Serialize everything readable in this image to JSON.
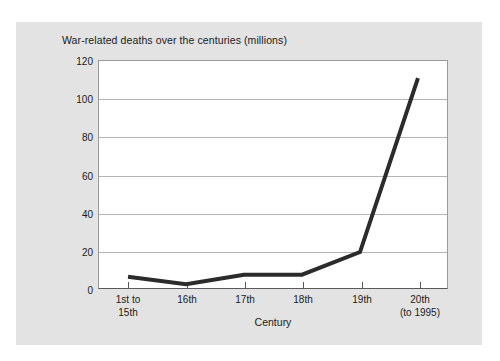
{
  "chart_data": {
    "type": "line",
    "title": "War-related deaths over the centuries (millions)",
    "xlabel": "Century",
    "ylabel": "",
    "categories": [
      "1st to\n15th",
      "16th",
      "17th",
      "18th",
      "19th",
      "20th\n(to 1995)"
    ],
    "category_labels": [
      [
        "1st to",
        "15th"
      ],
      [
        "16th"
      ],
      [
        "17th"
      ],
      [
        "18th"
      ],
      [
        "19th"
      ],
      [
        "20th",
        "(to 1995)"
      ]
    ],
    "values": [
      6,
      2,
      7,
      7,
      19,
      111
    ],
    "ylim": [
      0,
      120
    ],
    "ytick_labels": [
      "0",
      "20",
      "40",
      "60",
      "80",
      "100",
      "120"
    ],
    "yticks": [
      0,
      20,
      40,
      60,
      80,
      100,
      120
    ],
    "grid": "horizontal",
    "legend": "none",
    "series_color": "#2b2b2b",
    "series_width": 4,
    "plot_background": "#ffffff",
    "figure_background": "#e3e3e3",
    "gridline_color": "#b4b4b4",
    "axis_color": "#5a5a5a"
  }
}
